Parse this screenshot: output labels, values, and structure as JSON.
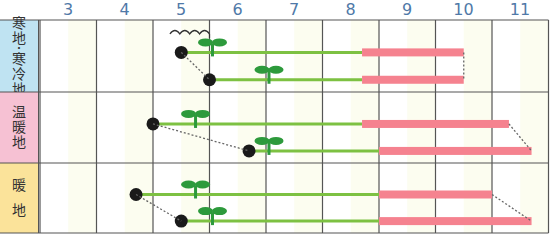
{
  "chart_data": {
    "type": "gantt",
    "title": "",
    "x_axis": {
      "label": "month",
      "ticks": [
        "3",
        "4",
        "5",
        "6",
        "7",
        "8",
        "9",
        "10",
        "11"
      ],
      "range": [
        3,
        11
      ]
    },
    "colors": {
      "growing": "#7dc142",
      "harvest": "#f5828f",
      "seedling": "#2d9a3c",
      "sow_dot": "#1a1a1a",
      "header": "#4f79a8"
    },
    "legend_symbols": {
      "sow": "black dot = sowing",
      "growing": "green line = growing period",
      "harvest": "pink bar = harvest period",
      "seedling": "sprout icon = germination",
      "tunnel": "wavy line = tunnel cover"
    },
    "regions": [
      {
        "name": "寒地・寒冷地",
        "label_chars": [
          "寒",
          "地",
          "・",
          "寒",
          "冷",
          "地"
        ],
        "bg": "#bfe3f2",
        "tunnel": {
          "from": 5.3,
          "to": 6.0
        },
        "rows": [
          {
            "sow": 5.5,
            "seedling": 6.0,
            "harvest_start": 8.7,
            "harvest_end": 10.5
          },
          {
            "sow": 6.0,
            "seedling": 7.0,
            "harvest_start": 8.7,
            "harvest_end": 10.5
          }
        ]
      },
      {
        "name": "温暖地",
        "label_chars": [
          "温",
          "暖",
          "地"
        ],
        "bg": "#f6c1d3",
        "rows": [
          {
            "sow": 5.0,
            "seedling": 5.7,
            "harvest_start": 8.7,
            "harvest_end": 11.3
          },
          {
            "sow": 6.7,
            "seedling": 7.0,
            "harvest_start": 9.0,
            "harvest_end": 11.7
          }
        ]
      },
      {
        "name": "暖地",
        "label_chars": [
          "暖",
          "地"
        ],
        "bg": "#fbe39a",
        "rows": [
          {
            "sow": 4.7,
            "seedling": 5.7,
            "harvest_start": 9.0,
            "harvest_end": 11.0
          },
          {
            "sow": 5.5,
            "seedling": 6.0,
            "harvest_start": 9.0,
            "harvest_end": 11.7
          }
        ]
      }
    ]
  }
}
